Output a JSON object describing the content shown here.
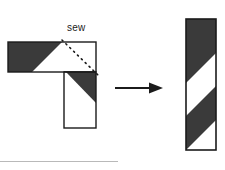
{
  "figure": {
    "type": "instructional-diagram",
    "canvas": {
      "width": 225,
      "height": 170,
      "background": "#ffffff"
    },
    "colors": {
      "fabric_dark": "#3a3a3a",
      "fabric_light": "#ffffff",
      "outline": "#1b1b1b",
      "arrow": "#1b1b1b",
      "label_text": "#1b1b1b",
      "footer_rule": "#b9b9b9"
    },
    "annotations": {
      "sew_label": "sew",
      "sew_line_style": "dotted",
      "sew_line_from": {
        "x": 62,
        "y": 40
      },
      "sew_line_to": {
        "x": 99,
        "y": 76
      }
    },
    "left_shape": {
      "name": "L-shaped joined strips",
      "horizontal_arm": {
        "x": 8,
        "y": 42,
        "width": 88,
        "height": 30
      },
      "vertical_arm": {
        "x": 64,
        "y": 72,
        "width": 32,
        "height": 56
      },
      "horizontal_dark_region": "left portion ending in a 45 degree diagonal",
      "vertical_dark_region": "upper-right triangle above a 45 degree diagonal",
      "diagonal_angle_degrees": 45
    },
    "arrow": {
      "name": "transformation arrow",
      "direction": "right",
      "shaft_from": {
        "x": 115,
        "y": 88
      },
      "shaft_to": {
        "x": 152,
        "y": 88
      },
      "head_length": 11,
      "head_half_width": 6
    },
    "right_shape": {
      "name": "finished striped strip",
      "x": 186,
      "y": 19,
      "width": 30,
      "height": 131,
      "stripe_angle_degrees": 45,
      "stripe_sequence": [
        "dark",
        "light",
        "dark",
        "light"
      ],
      "stripe_count": 4
    },
    "footer_rule": {
      "x": 0,
      "y": 161,
      "width": 120,
      "height": 1
    }
  }
}
